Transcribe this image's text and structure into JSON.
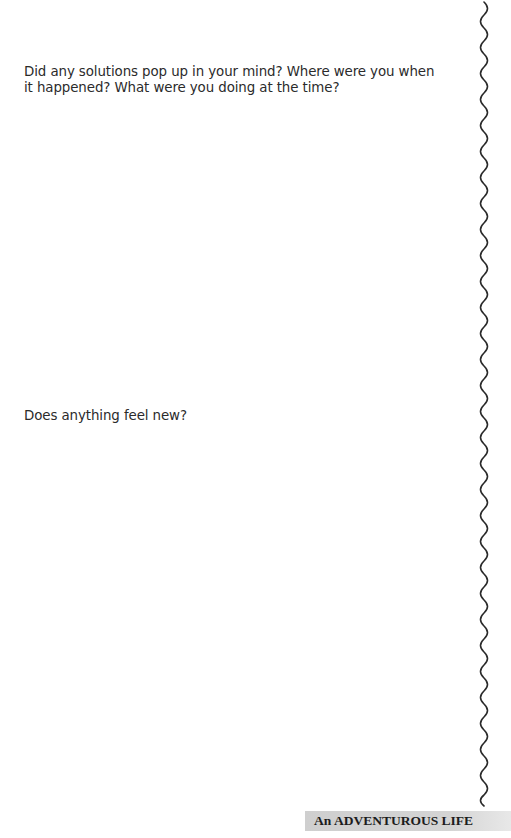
{
  "prompts": [
    {
      "text": "Did any solutions pop up in your mind? Where were you when it happened? What were you doing at the time?"
    },
    {
      "text": "Does anything feel new?"
    }
  ],
  "footer": {
    "running_title": "An ADVENTUROUS LIFE",
    "band_color": "#d0d0d0"
  },
  "decoration": {
    "margin_line": "wavy-vertical-line",
    "line_color": "#2a2a2a"
  }
}
